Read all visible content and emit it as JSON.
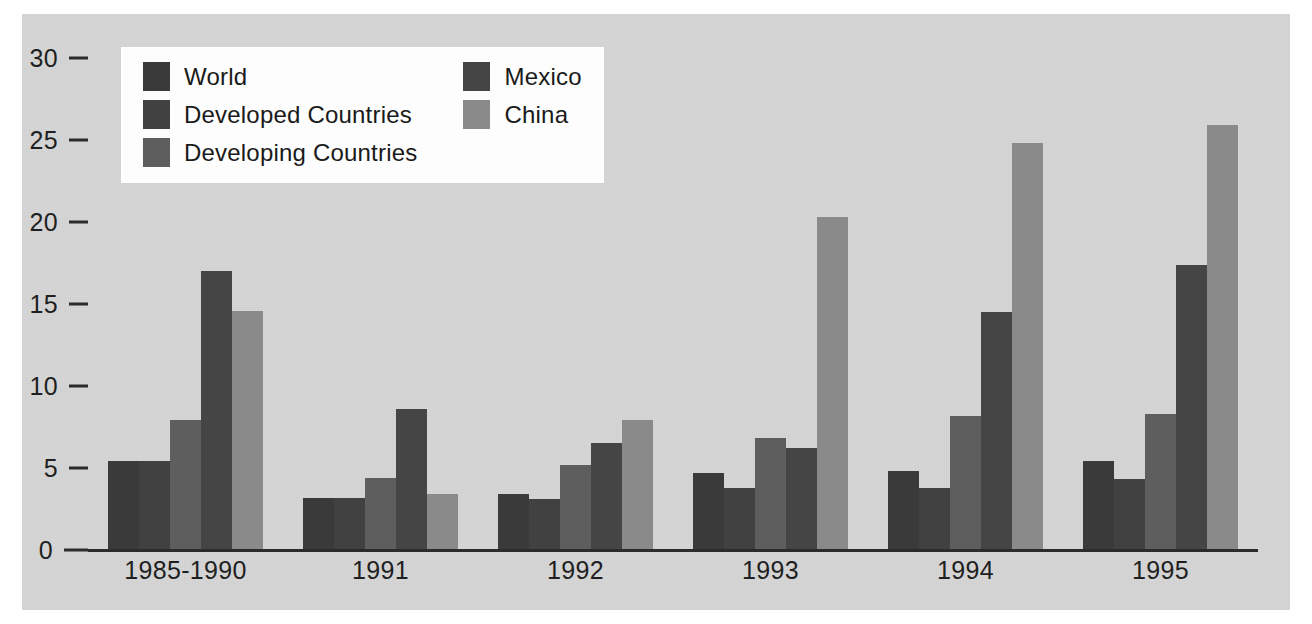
{
  "chart_data": {
    "type": "bar",
    "title": "",
    "subtitle": "",
    "xlabel": "",
    "ylabel": "",
    "ylim": [
      0,
      30
    ],
    "yticks": [
      0,
      5,
      10,
      15,
      20,
      25,
      30
    ],
    "ytick_labels": [
      "0",
      "5",
      "10",
      "15",
      "20",
      "25",
      "30"
    ],
    "grid": false,
    "legend_position": "top-left",
    "categories": [
      "1985-1990",
      "1991",
      "1992",
      "1993",
      "1994",
      "1995"
    ],
    "series": [
      {
        "name": "World",
        "color": "#3a3a3a",
        "values": [
          5.4,
          3.2,
          3.4,
          4.7,
          4.8,
          5.4
        ]
      },
      {
        "name": "Developed Countries",
        "color": "#414141",
        "values": [
          5.4,
          3.2,
          3.1,
          3.8,
          3.8,
          4.3
        ]
      },
      {
        "name": "Developing Countries",
        "color": "#5e5e5e",
        "values": [
          7.9,
          4.4,
          5.2,
          6.8,
          8.2,
          8.3
        ]
      },
      {
        "name": "Mexico",
        "color": "#454545",
        "values": [
          17.0,
          8.6,
          6.5,
          6.2,
          14.5,
          17.4
        ]
      },
      {
        "name": "China",
        "color": "#8a8a8a",
        "values": [
          14.6,
          3.4,
          7.9,
          20.3,
          24.8,
          25.9
        ]
      }
    ]
  },
  "legend": {
    "columns": [
      [
        {
          "label": "World",
          "color": "#3a3a3a"
        },
        {
          "label": "Developed Countries",
          "color": "#414141"
        },
        {
          "label": "Developing Countries",
          "color": "#5e5e5e"
        }
      ],
      [
        {
          "label": "Mexico",
          "color": "#454545"
        },
        {
          "label": "China",
          "color": "#8a8a8a"
        }
      ]
    ]
  },
  "colors": {
    "panel_background": "#d6d6d6",
    "page_background": "#ffffff",
    "axis": "#2b2b2b",
    "text": "#1f1f1f",
    "legend_background": "#fdfdfd"
  }
}
